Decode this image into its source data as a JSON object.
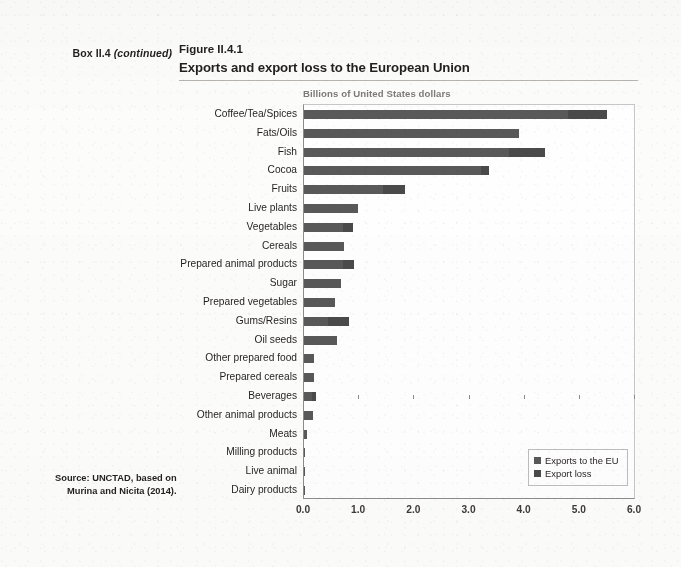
{
  "header": {
    "box_label_prefix": "Box II.4",
    "box_label_cont": "(continued)",
    "figure_number": "Figure II.4.1",
    "figure_title": "Exports and export loss to the European Union"
  },
  "source": {
    "line1": "Source: UNCTAD, based on",
    "line2": "Murina and Nicita (2014)."
  },
  "legend": {
    "position": "bottom-right",
    "items": [
      {
        "label": "Exports to the EU",
        "color": "#595959"
      },
      {
        "label": "Export loss",
        "color": "#4a4a4a"
      }
    ]
  },
  "chart_data": {
    "type": "bar",
    "orientation": "horizontal",
    "stacked": true,
    "title": "Exports and export loss to the European Union",
    "subtitle": "Figure II.4.1",
    "axis_title": "Billions of United States dollars",
    "xlabel": "Billions of United States dollars",
    "ylabel": "",
    "xlim": [
      0.0,
      6.0
    ],
    "xticks": [
      0.0,
      1.0,
      2.0,
      3.0,
      4.0,
      5.0,
      6.0
    ],
    "xticklabels": [
      "0.0",
      "1.0",
      "2.0",
      "3.0",
      "4.0",
      "5.0",
      "6.0"
    ],
    "grid": false,
    "categories": [
      "Coffee/Tea/Spices",
      "Fats/Oils",
      "Fish",
      "Cocoa",
      "Fruits",
      "Live plants",
      "Vegetables",
      "Cereals",
      "Prepared animal products",
      "Sugar",
      "Prepared vegetables",
      "Gums/Resins",
      "Oil seeds",
      "Other prepared food",
      "Prepared cereals",
      "Beverages",
      "Other animal products",
      "Meats",
      "Milling products",
      "Live animal",
      "Dairy products"
    ],
    "series": [
      {
        "name": "Exports to the EU",
        "color": "#595959",
        "values": [
          4.79,
          3.9,
          3.71,
          3.2,
          1.43,
          0.97,
          0.71,
          0.73,
          0.71,
          0.67,
          0.57,
          0.43,
          0.6,
          0.19,
          0.18,
          0.14,
          0.17,
          0.05,
          0.02,
          0.02,
          0.02
        ]
      },
      {
        "name": "Export loss",
        "color": "#4a4a4a",
        "values": [
          0.71,
          0.0,
          0.66,
          0.16,
          0.41,
          0.0,
          0.18,
          0.0,
          0.19,
          0.0,
          0.0,
          0.38,
          0.0,
          0.0,
          0.0,
          0.08,
          0.0,
          0.0,
          0.0,
          0.0,
          0.0
        ]
      }
    ],
    "totals": [
      5.5,
      3.9,
      4.37,
      3.36,
      1.84,
      0.97,
      0.89,
      0.73,
      0.9,
      0.67,
      0.57,
      0.81,
      0.6,
      0.19,
      0.18,
      0.22,
      0.17,
      0.05,
      0.02,
      0.02,
      0.02
    ]
  }
}
